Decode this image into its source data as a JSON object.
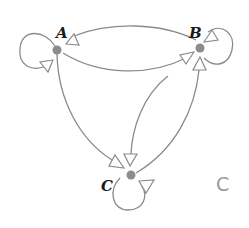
{
  "diagram": {
    "type": "directed-graph",
    "colors": {
      "edge": "#8a8a8a",
      "node": "#8c8c8c",
      "label": "#1a1a1a",
      "corner_label": "#9a9a9a"
    },
    "nodes": [
      {
        "id": "A",
        "label": "A"
      },
      {
        "id": "B",
        "label": "B"
      },
      {
        "id": "C",
        "label": "C"
      }
    ],
    "edges": [
      {
        "from": "A",
        "to": "A",
        "kind": "self-loop"
      },
      {
        "from": "B",
        "to": "B",
        "kind": "self-loop"
      },
      {
        "from": "C",
        "to": "C",
        "kind": "self-loop"
      },
      {
        "from": "B",
        "to": "A"
      },
      {
        "from": "A",
        "to": "B"
      },
      {
        "from": "A",
        "to": "C"
      },
      {
        "from": "B",
        "to": "C"
      },
      {
        "from": "C",
        "to": "B"
      }
    ],
    "corner_label": "C"
  }
}
